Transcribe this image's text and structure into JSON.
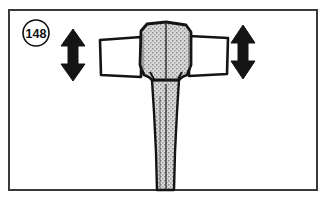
{
  "figure": {
    "kind": "technical-line-illustration",
    "caption_number": "148",
    "background_color": "#ffffff",
    "border": {
      "name": "figure-frame",
      "color": "#3a3a3a",
      "thickness_px": 2,
      "x": 8,
      "y": 9,
      "width": 310,
      "height": 182
    },
    "callout_badge": {
      "name": "figure-number-badge",
      "label": "148",
      "shape": "circle",
      "center_x": 36,
      "center_y": 33,
      "radius": 13,
      "stroke_color": "#111111",
      "fill_color": "#ffffff",
      "text_color": "#111111"
    },
    "arrows": [
      {
        "name": "left-double-arrow",
        "direction": "vertical-double-headed",
        "meaning": "up-and-down-movement",
        "color": "#141414",
        "center_x": 73,
        "top_y": 29,
        "bottom_y": 81
      },
      {
        "name": "right-double-arrow",
        "direction": "vertical-double-headed",
        "meaning": "up-and-down-movement",
        "color": "#141414",
        "center_x": 243,
        "top_y": 25,
        "bottom_y": 79
      }
    ],
    "parts": [
      {
        "name": "mallet-head-block",
        "description": "central stippled head block",
        "fill": "stipple-texture",
        "fill_color": "#d8d8d8",
        "outline_color": "#141414",
        "x": 139,
        "y": 23,
        "width": 52,
        "height": 56
      },
      {
        "name": "left-face-flange",
        "description": "left white rectangular striking face",
        "fill_color": "#ffffff",
        "outline_color": "#141414",
        "x": 99,
        "y": 38,
        "width": 41,
        "height": 39
      },
      {
        "name": "right-face-flange",
        "description": "right white rectangular striking face",
        "fill_color": "#ffffff",
        "outline_color": "#141414",
        "x": 190,
        "y": 35,
        "width": 38,
        "height": 40
      },
      {
        "name": "mallet-shaft",
        "description": "tapering stippled shaft running to bottom of frame",
        "fill": "stipple-texture",
        "fill_color": "#d8d8d8",
        "outline_color": "#141414",
        "top_y": 79,
        "bottom_y": 189,
        "top_width": 30,
        "bottom_width": 22
      },
      {
        "name": "shaft-center-line",
        "description": "vertical seam line through head and shaft",
        "color": "#2a2a2a"
      }
    ]
  }
}
